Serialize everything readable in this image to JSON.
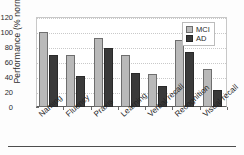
{
  "chart_data": {
    "type": "bar",
    "title": "",
    "xlabel": "",
    "ylabel": "Performance (% normal)",
    "ylim": [
      0,
      120
    ],
    "yticks": [
      0,
      20,
      40,
      60,
      80,
      100,
      120
    ],
    "grid": true,
    "legend_position": "top-right",
    "categories": [
      "Naming",
      "Fluency",
      "Praxis",
      "Learning",
      "Verbal recall",
      "Recognition",
      "Visual recall"
    ],
    "series": [
      {
        "name": "MCI",
        "color": "#b9b9b9",
        "values": [
          100,
          70,
          92,
          70,
          44,
          89,
          51
        ]
      },
      {
        "name": "AD",
        "color": "#3a3a3a",
        "values": [
          69,
          41,
          79,
          45,
          28,
          74,
          23
        ]
      }
    ]
  }
}
